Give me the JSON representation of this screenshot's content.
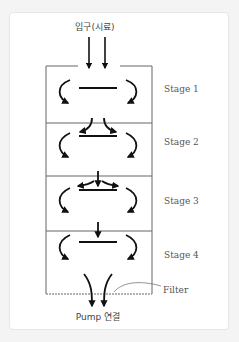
{
  "diagram": {
    "inlet_label": "입구(시료)",
    "outlet_label": "Pump 연결",
    "filter_label": "Filter",
    "stages": [
      {
        "label": "Stage 1"
      },
      {
        "label": "Stage 2"
      },
      {
        "label": "Stage 3"
      },
      {
        "label": "Stage 4"
      }
    ],
    "colors": {
      "line": "#111111",
      "box": "#666666",
      "text": "#555555",
      "card_border": "#e6e6e6"
    }
  }
}
